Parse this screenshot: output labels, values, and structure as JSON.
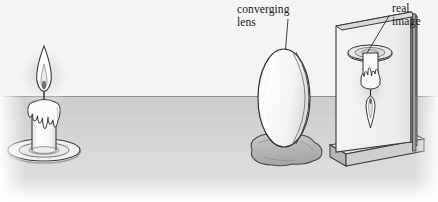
{
  "figure": {
    "width": 438,
    "height": 202,
    "background_color": "#ffffff"
  },
  "labels": {
    "converging_lens": {
      "line1": "converging",
      "line2": "lens"
    },
    "real_image": {
      "line1": "real",
      "line2": "image"
    }
  },
  "objects": {
    "candle": {
      "name": "candle-with-flame",
      "parts": [
        "flame",
        "wick",
        "dripping-wax",
        "candle-body",
        "saucer"
      ]
    },
    "lens": {
      "name": "converging-lens",
      "shape": "ellipse",
      "support": "clay-lump"
    },
    "screen": {
      "name": "projection-screen",
      "support": "rail-base",
      "image_shown": "inverted-candle"
    }
  },
  "colors": {
    "outline": "#3a3a3a",
    "wall": "#f2f2f2",
    "table_top": "#cfcfcf",
    "table_front": "#dedede",
    "lens_fill": "#f7f7f7",
    "clay_fill": "#b9b9b9",
    "screen_fill": "#efefef",
    "screen_edge": "#9a9a9a",
    "base_fill": "#d4d4d4",
    "flame_glow": "#e8e8e8",
    "candle_fill": "#fbfbfb",
    "saucer_fill": "#e3e3e3"
  },
  "geometry": {
    "horizon_y": 96,
    "candle_x": 58,
    "lens_cx": 286,
    "screen_x": 340
  }
}
